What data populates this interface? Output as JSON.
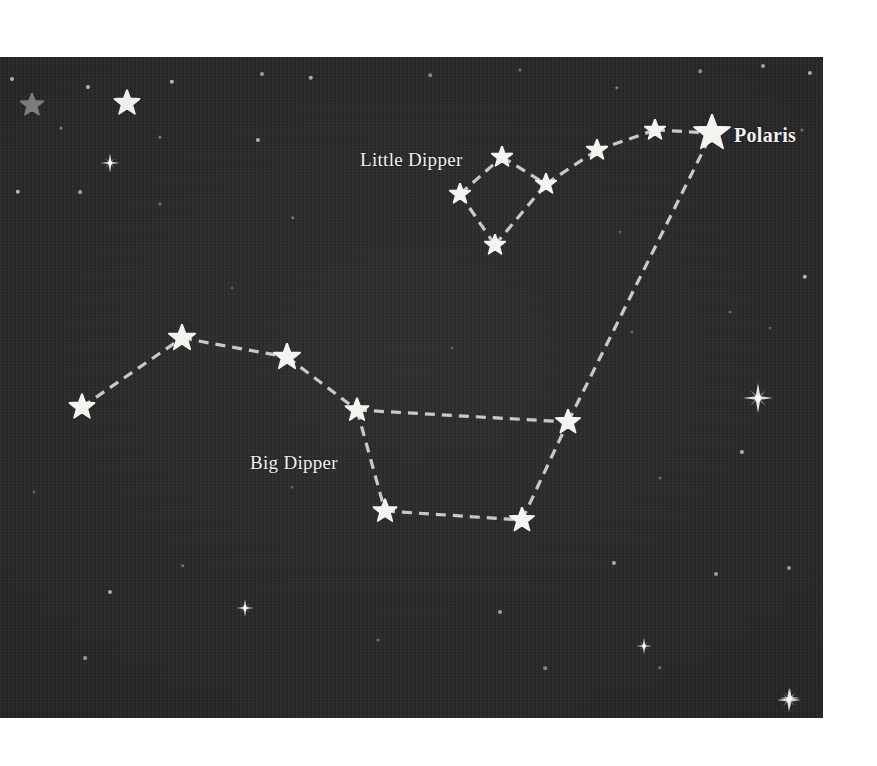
{
  "scene": {
    "kind": "star-chart",
    "title": "Big Dipper and Little Dipper star chart",
    "background_color": "#272627",
    "star_color": "#f4f3f0",
    "dim_star_color": "#7c7c79",
    "line_color": "#c9c8c5",
    "label_color": "#f2f1ef",
    "frame": {
      "x": 0,
      "y": 57,
      "width": 823,
      "height": 661
    }
  },
  "labels": [
    {
      "id": "little-dipper",
      "text": "Little Dipper",
      "x": 360,
      "y": 149,
      "style": "constellation",
      "anchor": "left"
    },
    {
      "id": "big-dipper",
      "text": "Big Dipper",
      "x": 250,
      "y": 452,
      "style": "constellation",
      "anchor": "left"
    },
    {
      "id": "polaris",
      "text": "Polaris",
      "x": 734,
      "y": 124,
      "style": "primary-star",
      "anchor": "left"
    }
  ],
  "constellations": [
    {
      "name": "Big Dipper",
      "stars": [
        {
          "id": "alkaid",
          "x": 82,
          "y": 407,
          "size": 27
        },
        {
          "id": "mizar",
          "x": 182,
          "y": 338,
          "size": 28
        },
        {
          "id": "alioth",
          "x": 287,
          "y": 357,
          "size": 28
        },
        {
          "id": "megrez",
          "x": 357,
          "y": 410,
          "size": 25
        },
        {
          "id": "phecda",
          "x": 385,
          "y": 511,
          "size": 25
        },
        {
          "id": "merak",
          "x": 522,
          "y": 520,
          "size": 26
        },
        {
          "id": "dubhe",
          "x": 568,
          "y": 422,
          "size": 26
        }
      ],
      "segments": [
        [
          "alkaid",
          "mizar"
        ],
        [
          "mizar",
          "alioth"
        ],
        [
          "alioth",
          "megrez"
        ],
        [
          "megrez",
          "phecda"
        ],
        [
          "megrez",
          "dubhe"
        ],
        [
          "phecda",
          "merak"
        ],
        [
          "merak",
          "dubhe"
        ]
      ]
    },
    {
      "name": "Little Dipper",
      "stars": [
        {
          "id": "kochab",
          "x": 460,
          "y": 194,
          "size": 22
        },
        {
          "id": "pherkad",
          "x": 502,
          "y": 157,
          "size": 22
        },
        {
          "id": "zeta-ursae-minoris",
          "x": 495,
          "y": 245,
          "size": 22
        },
        {
          "id": "eta-ursae-minoris",
          "x": 546,
          "y": 184,
          "size": 22
        },
        {
          "id": "gamma-ursae-minoris",
          "x": 597,
          "y": 150,
          "size": 22
        },
        {
          "id": "delta-ursae-minoris",
          "x": 655,
          "y": 130,
          "size": 22
        },
        {
          "id": "polaris-star",
          "x": 712,
          "y": 133,
          "size": 38
        }
      ],
      "segments": [
        [
          "kochab",
          "pherkad"
        ],
        [
          "pherkad",
          "eta-ursae-minoris"
        ],
        [
          "kochab",
          "zeta-ursae-minoris"
        ],
        [
          "zeta-ursae-minoris",
          "eta-ursae-minoris"
        ],
        [
          "eta-ursae-minoris",
          "gamma-ursae-minoris"
        ],
        [
          "gamma-ursae-minoris",
          "delta-ursae-minoris"
        ],
        [
          "delta-ursae-minoris",
          "polaris-star"
        ]
      ]
    }
  ],
  "pointer_line": {
    "name": "pointer-line-to-polaris",
    "from": "dubhe",
    "to": "polaris-star",
    "from_point": {
      "x": 568,
      "y": 422
    },
    "to_point": {
      "x": 712,
      "y": 133
    }
  },
  "decorative_stars": [
    {
      "id": "gray-star-top-left",
      "x": 32,
      "y": 105,
      "size": 24,
      "color": "#7c7c79",
      "kind": "polygon"
    },
    {
      "id": "white-star-top-left",
      "x": 127,
      "y": 103,
      "size": 27,
      "color": "#f0efec",
      "kind": "polygon"
    }
  ],
  "sparkles": [
    {
      "id": "sparkle-upper-left",
      "x": 110,
      "y": 163,
      "size": 19
    },
    {
      "id": "sparkle-right-mid",
      "x": 758,
      "y": 398,
      "size": 30
    },
    {
      "id": "sparkle-lower-left",
      "x": 245,
      "y": 608,
      "size": 17
    },
    {
      "id": "sparkle-lower-mid",
      "x": 644,
      "y": 646,
      "size": 16
    },
    {
      "id": "sparkle-bottom-right",
      "x": 789,
      "y": 700,
      "size": 24
    },
    {
      "id": "sparkle-lower-right",
      "x": 790,
      "y": 698,
      "size": 20
    }
  ],
  "background_dots": [
    {
      "x": 12,
      "y": 79,
      "r": 2.0,
      "o": 0.8
    },
    {
      "x": 61,
      "y": 128,
      "r": 1.6,
      "o": 0.55
    },
    {
      "x": 88,
      "y": 87,
      "r": 2.1,
      "o": 0.85
    },
    {
      "x": 172,
      "y": 82,
      "r": 2.2,
      "o": 0.85
    },
    {
      "x": 160,
      "y": 137,
      "r": 1.6,
      "o": 0.5
    },
    {
      "x": 18,
      "y": 192,
      "r": 2.2,
      "o": 0.85
    },
    {
      "x": 80,
      "y": 192,
      "r": 1.9,
      "o": 0.7
    },
    {
      "x": 160,
      "y": 204,
      "r": 1.6,
      "o": 0.45
    },
    {
      "x": 262,
      "y": 74,
      "r": 2.0,
      "o": 0.7
    },
    {
      "x": 311,
      "y": 78,
      "r": 2.2,
      "o": 0.8
    },
    {
      "x": 258,
      "y": 140,
      "r": 2.1,
      "o": 0.8
    },
    {
      "x": 293,
      "y": 218,
      "r": 1.7,
      "o": 0.45
    },
    {
      "x": 430,
      "y": 75,
      "r": 1.8,
      "o": 0.55
    },
    {
      "x": 520,
      "y": 70,
      "r": 1.6,
      "o": 0.45
    },
    {
      "x": 617,
      "y": 88,
      "r": 1.7,
      "o": 0.5
    },
    {
      "x": 700,
      "y": 71,
      "r": 1.8,
      "o": 0.6
    },
    {
      "x": 763,
      "y": 66,
      "r": 2.0,
      "o": 0.75
    },
    {
      "x": 810,
      "y": 73,
      "r": 2.1,
      "o": 0.8
    },
    {
      "x": 802,
      "y": 130,
      "r": 1.6,
      "o": 0.45
    },
    {
      "x": 805,
      "y": 277,
      "r": 2.2,
      "o": 0.85
    },
    {
      "x": 730,
      "y": 312,
      "r": 1.6,
      "o": 0.35
    },
    {
      "x": 742,
      "y": 452,
      "r": 2.1,
      "o": 0.8
    },
    {
      "x": 770,
      "y": 328,
      "r": 1.5,
      "o": 0.3
    },
    {
      "x": 632,
      "y": 332,
      "r": 1.6,
      "o": 0.35
    },
    {
      "x": 660,
      "y": 478,
      "r": 1.6,
      "o": 0.4
    },
    {
      "x": 614,
      "y": 563,
      "r": 2.1,
      "o": 0.8
    },
    {
      "x": 716,
      "y": 574,
      "r": 2.0,
      "o": 0.7
    },
    {
      "x": 789,
      "y": 568,
      "r": 2.0,
      "o": 0.7
    },
    {
      "x": 660,
      "y": 668,
      "r": 1.7,
      "o": 0.45
    },
    {
      "x": 545,
      "y": 668,
      "r": 1.8,
      "o": 0.55
    },
    {
      "x": 500,
      "y": 612,
      "r": 2.0,
      "o": 0.7
    },
    {
      "x": 378,
      "y": 640,
      "r": 1.6,
      "o": 0.4
    },
    {
      "x": 183,
      "y": 566,
      "r": 1.7,
      "o": 0.45
    },
    {
      "x": 110,
      "y": 592,
      "r": 2.1,
      "o": 0.8
    },
    {
      "x": 85,
      "y": 658,
      "r": 1.9,
      "o": 0.65
    },
    {
      "x": 34,
      "y": 492,
      "r": 1.6,
      "o": 0.35
    },
    {
      "x": 292,
      "y": 487,
      "r": 1.5,
      "o": 0.3
    },
    {
      "x": 452,
      "y": 348,
      "r": 1.5,
      "o": 0.28
    },
    {
      "x": 620,
      "y": 232,
      "r": 1.5,
      "o": 0.3
    },
    {
      "x": 232,
      "y": 288,
      "r": 1.5,
      "o": 0.28
    }
  ]
}
